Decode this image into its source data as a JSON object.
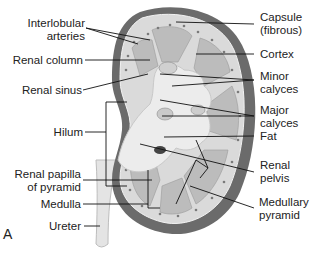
{
  "figure": {
    "panel_letter": "A",
    "colors": {
      "capsule": "#6b6b6b",
      "cortex": "#d8d8d8",
      "medulla": "#bdbdbd",
      "sinus": "#e9e9e9",
      "ureter": "#e2e2e2",
      "leader_line": "#111111",
      "text": "#222222"
    }
  },
  "labels_left": [
    {
      "line1": "Interlobular",
      "line2": "arteries"
    },
    {
      "line1": "Renal column",
      "line2": ""
    },
    {
      "line1": "Renal sinus",
      "line2": ""
    },
    {
      "line1": "Hilum",
      "line2": ""
    },
    {
      "line1": "Renal papilla",
      "line2": "of pyramid"
    },
    {
      "line1": "Medulla",
      "line2": ""
    },
    {
      "line1": "Ureter",
      "line2": ""
    }
  ],
  "labels_right": [
    {
      "line1": "Capsule",
      "line2": "(fibrous)"
    },
    {
      "line1": "Cortex",
      "line2": ""
    },
    {
      "line1": "Minor",
      "line2": "calyces"
    },
    {
      "line1": "Major",
      "line2": "calyces"
    },
    {
      "line1": "Fat",
      "line2": ""
    },
    {
      "line1": "Renal",
      "line2": "pelvis"
    },
    {
      "line1": "Medullary",
      "line2": "pyramid"
    }
  ]
}
